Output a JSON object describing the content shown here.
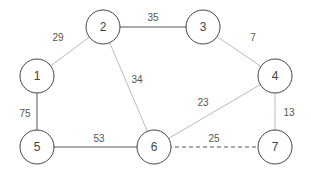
{
  "diagram": {
    "type": "weighted-undirected-graph",
    "nodes": [
      {
        "id": "1",
        "label": "1",
        "x": 37,
        "y": 76
      },
      {
        "id": "2",
        "label": "2",
        "x": 103,
        "y": 27
      },
      {
        "id": "3",
        "label": "3",
        "x": 203,
        "y": 27
      },
      {
        "id": "4",
        "label": "4",
        "x": 275,
        "y": 76
      },
      {
        "id": "5",
        "label": "5",
        "x": 37,
        "y": 147
      },
      {
        "id": "6",
        "label": "6",
        "x": 154,
        "y": 147
      },
      {
        "id": "7",
        "label": "7",
        "x": 275,
        "y": 147
      }
    ],
    "edges": [
      {
        "from": "1",
        "to": "2",
        "weight": "29",
        "style": "light",
        "lx": 58,
        "ly": 37
      },
      {
        "from": "2",
        "to": "3",
        "weight": "35",
        "style": "dark",
        "lx": 153,
        "ly": 17
      },
      {
        "from": "2",
        "to": "6",
        "weight": "34",
        "style": "light",
        "lx": 137,
        "ly": 79
      },
      {
        "from": "3",
        "to": "4",
        "weight": "7",
        "style": "light",
        "lx": 253,
        "ly": 37
      },
      {
        "from": "1",
        "to": "5",
        "weight": "75",
        "style": "dark",
        "lx": 25,
        "ly": 113
      },
      {
        "from": "5",
        "to": "6",
        "weight": "53",
        "style": "dark",
        "lx": 99,
        "ly": 138
      },
      {
        "from": "4",
        "to": "6",
        "weight": "23",
        "style": "light",
        "lx": 203,
        "ly": 102
      },
      {
        "from": "4",
        "to": "7",
        "weight": "13",
        "style": "light",
        "lx": 289,
        "ly": 112
      },
      {
        "from": "6",
        "to": "7",
        "weight": "25",
        "style": "dashed",
        "lx": 214,
        "ly": 138
      }
    ],
    "colors": {
      "dark": "#555555",
      "light": "#bbbbbb",
      "dashed": "#555555",
      "node_stroke": "#444444"
    }
  }
}
